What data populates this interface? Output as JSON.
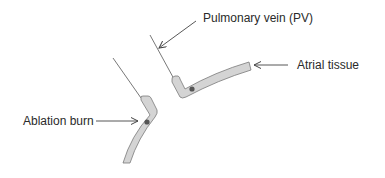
{
  "diagram": {
    "labels": {
      "pulmonary_vein": "Pulmonary vein (PV)",
      "atrial_tissue": "Atrial tissue",
      "ablation_burn": "Ablation burn"
    },
    "colors": {
      "tissue_fill": "#d4d4d4",
      "tissue_stroke": "#7a7a7a",
      "line": "#555555",
      "burn_dot": "#555555",
      "text": "#2a2a2a"
    }
  }
}
